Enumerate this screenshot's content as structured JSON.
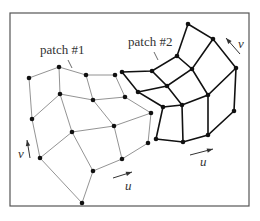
{
  "figure": {
    "frame": {
      "x": 10,
      "y": 13,
      "width": 109,
      "height": 193
    },
    "patches": [
      {
        "label": "patch #1",
        "label_pos": [
          40,
          54
        ],
        "leader": [
          [
            68,
            60
          ],
          [
            72,
            68
          ]
        ],
        "style": "thin",
        "grid": [
          [
            [
              29,
              78
            ],
            [
              59,
              67
            ],
            [
              86,
              75
            ],
            [
              115,
              75
            ]
          ],
          [
            [
              32,
              119
            ],
            [
              60,
              94
            ],
            [
              93,
              100
            ],
            [
              125,
              97
            ]
          ],
          [
            [
              40,
              158
            ],
            [
              72,
              132
            ],
            [
              114,
              126
            ],
            [
              151,
              113
            ]
          ],
          [
            [
              82,
              203
            ],
            [
              93,
              171
            ],
            [
              122,
              159
            ],
            [
              148,
              143
            ]
          ]
        ],
        "axes": {
          "v": {
            "label": "v",
            "arrow": [
              [
                30,
                158
              ],
              [
                27,
                140
              ]
            ],
            "label_pos": [
              18,
              158
            ]
          },
          "u": {
            "label": "u",
            "arrow": [
              [
                113,
                178
              ],
              [
                132,
                172
              ]
            ],
            "label_pos": [
              125,
              190
            ]
          }
        }
      },
      {
        "label": "patch #2",
        "label_pos": [
          128,
          46
        ],
        "leader": [
          [
            154,
            52
          ],
          [
            158,
            60
          ]
        ],
        "style": "thick",
        "grid": [
          [
            [
              156,
              139
            ],
            [
              183,
              142
            ],
            [
              208,
              135
            ],
            [
              234,
              111
            ]
          ],
          [
            [
              163,
              107
            ],
            [
              182,
              105
            ],
            [
              208,
              95
            ],
            [
              236,
              68
            ]
          ],
          [
            [
              138,
              92
            ],
            [
              167,
              86
            ],
            [
              192,
              69
            ],
            [
              213,
              39
            ]
          ],
          [
            [
              122,
              72
            ],
            [
              152,
              71
            ],
            [
              177,
              56
            ],
            [
              188,
              24
            ]
          ]
        ],
        "axes": {
          "v": {
            "label": "v",
            "arrow": [
              [
                240,
                54
              ],
              [
                226,
                38
              ]
            ],
            "label_pos": [
              238,
              48
            ]
          },
          "u": {
            "label": "u",
            "arrow": [
              [
                190,
                155
              ],
              [
                213,
                149
              ]
            ],
            "label_pos": [
              200,
              166
            ]
          }
        }
      }
    ]
  }
}
